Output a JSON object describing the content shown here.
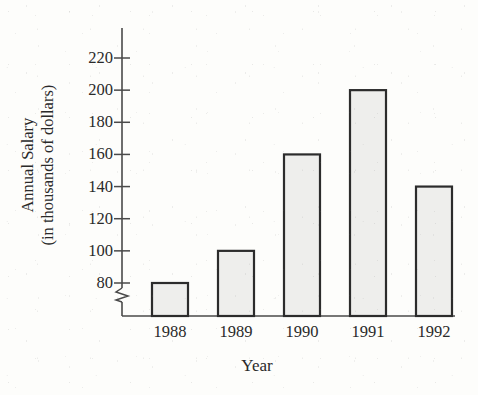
{
  "chart_data": {
    "type": "bar",
    "title": "",
    "subtitle": "",
    "xlabel": "Year",
    "ylabel": "Annual Salary (in thousands of dollars)",
    "ylabel_lines": [
      "Annual Salary",
      "(in thousands of dollars)"
    ],
    "categories": [
      "1988",
      "1989",
      "1990",
      "1991",
      "1992"
    ],
    "values": [
      80,
      100,
      160,
      200,
      140
    ],
    "value_unit": "thousands of dollars",
    "yticks": [
      80,
      100,
      120,
      140,
      160,
      180,
      200,
      220
    ],
    "ytick_labels": [
      "80",
      "100",
      "120",
      "140",
      "160",
      "180",
      "200",
      "220"
    ],
    "ylim": [
      80,
      220
    ],
    "y_axis_break": true,
    "y_axis_break_note": "zigzag break between baseline and 80",
    "grid": false,
    "legend": null,
    "bar_fill_color": "#eeeeec",
    "bar_edge_color": "#2c2c2c",
    "axis_color": "#4a4a4a",
    "background_color": "#fdfdfb"
  },
  "axes": {
    "y_title_line1": "Annual Salary",
    "y_title_line2": "(in thousands of dollars)",
    "x_title": "Year"
  },
  "icons": {
    "axis_break": "axis-break-zigzag"
  }
}
